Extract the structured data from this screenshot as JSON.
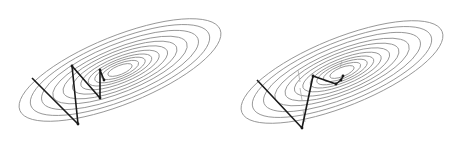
{
  "figure": {
    "panels": [
      {
        "id": "left",
        "description": "Gradient descent without momentum (zigzag path)",
        "center": [
          120,
          70
        ],
        "rotation_deg": -22,
        "contours": [
          [
            108,
            34
          ],
          [
            96,
            30
          ],
          [
            84,
            26
          ],
          [
            72,
            22
          ],
          [
            61,
            19
          ],
          [
            51,
            16
          ],
          [
            42,
            13
          ],
          [
            34,
            10.5
          ],
          [
            27,
            8.5
          ],
          [
            20,
            6.5
          ],
          [
            13,
            4.5
          ]
        ],
        "path": [
          [
            32,
            78
          ],
          [
            78,
            124
          ],
          [
            72,
            66
          ],
          [
            100,
            98
          ],
          [
            100,
            70
          ],
          [
            104,
            80
          ]
        ],
        "path_color": "#1a1a1a",
        "contour_color": "#8a8a8a"
      },
      {
        "id": "right",
        "description": "Gradient descent with momentum (smoother path)",
        "center": [
          342,
          72
        ],
        "rotation_deg": -22,
        "contours": [
          [
            108,
            34
          ],
          [
            96,
            30
          ],
          [
            84,
            26
          ],
          [
            72,
            22
          ],
          [
            61,
            19
          ],
          [
            51,
            16
          ],
          [
            42,
            13
          ],
          [
            34,
            10.5
          ],
          [
            27,
            8.5
          ],
          [
            20,
            6.5
          ],
          [
            13,
            4.5
          ]
        ],
        "path": [
          [
            257,
            80
          ],
          [
            302,
            128
          ],
          [
            313,
            76
          ],
          [
            336,
            84
          ],
          [
            341,
            80
          ],
          [
            343,
            76
          ]
        ],
        "gradient_arrows": [
          [
            [
              298,
              70
            ],
            [
              300,
              82
            ]
          ],
          [
            [
              300,
              88
            ],
            [
              302,
              100
            ]
          ],
          [
            [
              303,
              110
            ],
            [
              305,
              122
            ]
          ],
          [
            [
              340,
              68
            ],
            [
              342,
              60
            ]
          ]
        ],
        "path_color": "#1a1a1a",
        "arrow_color": "#aaaaaa",
        "contour_color": "#8a8a8a"
      }
    ]
  }
}
